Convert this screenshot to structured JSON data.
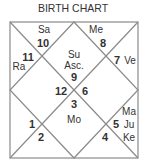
{
  "title": "BIRTH CHART",
  "colors": {
    "line": "#8a8a8a",
    "text": "#333333",
    "background": "#ffffff"
  },
  "houses": [
    {
      "number": "1",
      "planets": []
    },
    {
      "number": "2",
      "planets": []
    },
    {
      "number": "3",
      "planets": [
        "Mo"
      ]
    },
    {
      "number": "4",
      "planets": []
    },
    {
      "number": "5",
      "planets": [
        "Ma",
        "Ju",
        "Ke"
      ]
    },
    {
      "number": "6",
      "planets": []
    },
    {
      "number": "7",
      "planets": [
        "Ve"
      ]
    },
    {
      "number": "8",
      "planets": [
        "Me"
      ]
    },
    {
      "number": "9",
      "planets": [
        "Su",
        "Asc."
      ]
    },
    {
      "number": "10",
      "planets": [
        "Sa"
      ]
    },
    {
      "number": "11",
      "planets": [
        "Ra"
      ]
    },
    {
      "number": "12",
      "planets": []
    }
  ]
}
